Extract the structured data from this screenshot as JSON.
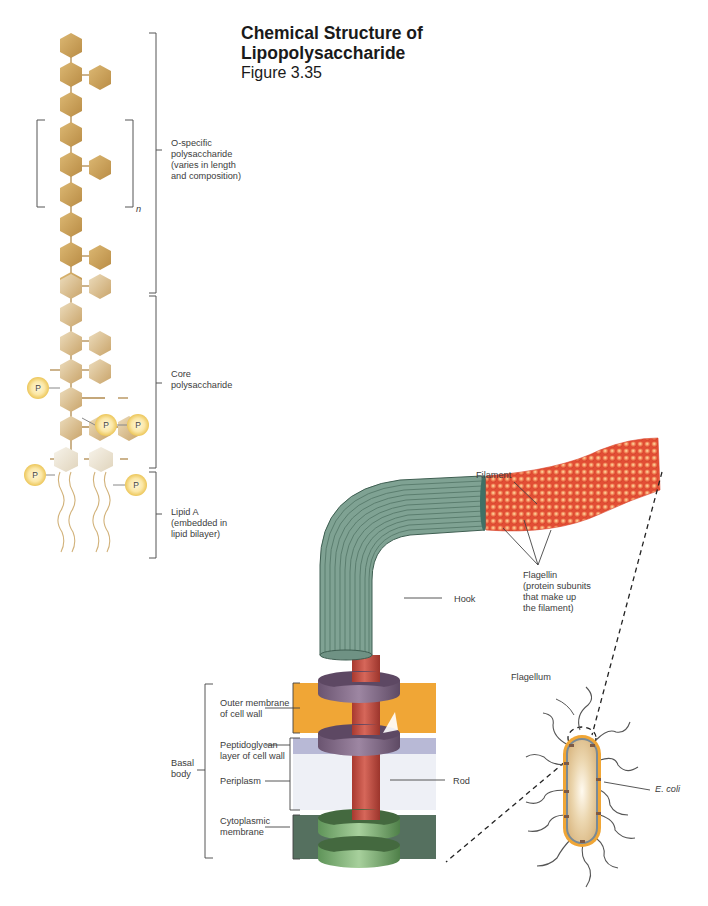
{
  "figure": {
    "title_line1": "Chemical Structure of",
    "title_line2": "Lipopolysaccharide",
    "figure_number": "Figure 3.35"
  },
  "lps": {
    "labels": {
      "o_specific": "O-specific\npolysaccharide\n(varies in length\nand composition)",
      "core": "Core\npolysaccharide",
      "lipid_a": "Lipid A\n(embedded in\nlipid bilayer)",
      "repeat_n": "n",
      "phosphate": "P"
    },
    "colors": {
      "sugar_dark": "#c9a05a",
      "sugar_light": "#e2cba0",
      "core_sugar": "#dcc092",
      "lipid_head": "#eee6d6",
      "phosphate_fill": "#f2d57a",
      "bracket": "#555555"
    }
  },
  "flagellum": {
    "labels": {
      "filament": "Filament",
      "flagellin": "Flagellin\n(protein subunits\nthat make up\nthe filament)",
      "hook": "Hook",
      "rod": "Rod",
      "basal_body": "Basal\nbody",
      "outer_membrane": "Outer membrane\nof cell wall",
      "peptidoglycan": "Peptidoglycan\nlayer of cell wall",
      "periplasm": "Periplasm",
      "cytoplasmic_membrane": "Cytoplasmic\nmembrane",
      "flagellum": "Flagellum",
      "ecoli": "E. coli"
    },
    "colors": {
      "filament": "#e8553a",
      "filament_highlight": "#f7b889",
      "hook": "#7fa293",
      "hook_stripe": "#5e8273",
      "rod": "#c95445",
      "ring_purple": "#7c6582",
      "ring_green": "#7fae77",
      "outer_membrane": "#f0a636",
      "peptidoglycan": "#b8b9d6",
      "periplasm": "#eef0f6",
      "cytoplasmic": "#55705f",
      "ecoli_fill": "#e8cfa0",
      "ecoli_border": "#f0a636"
    }
  }
}
